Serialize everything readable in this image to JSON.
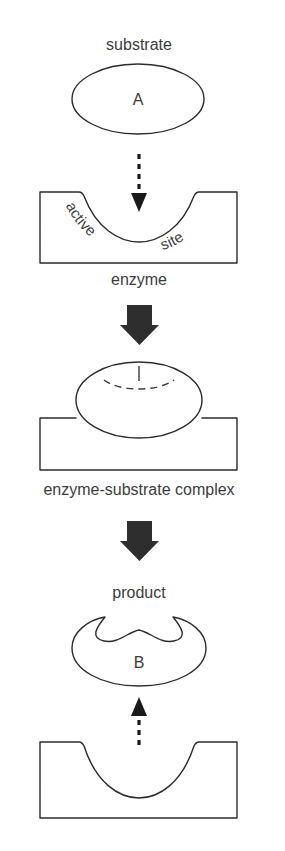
{
  "diagram": {
    "colors": {
      "background": "#ffffff",
      "outline": "#2b2b2b",
      "text": "#3c3c3c",
      "solid_arrow": "#2e2e2e",
      "dashed_arrow": "#1a1a1a"
    },
    "labels": {
      "substrate": "substrate",
      "substrate_letter": "A",
      "active_site": "active site",
      "active_site_word_1": "active",
      "active_site_word_2": "site",
      "enzyme": "enzyme",
      "complex": "enzyme-substrate complex",
      "product": "product",
      "product_letter": "B"
    },
    "stages": [
      {
        "name": "substrate-stage",
        "shape": "ellipse",
        "label": "substrate",
        "inner_letter": "A"
      },
      {
        "name": "enzyme-stage",
        "shape": "block-with-concave-notch",
        "label": "enzyme",
        "inner_label": "active site"
      },
      {
        "name": "complex-stage",
        "shape": "block-with-ellipse-bound",
        "label": "enzyme-substrate complex"
      },
      {
        "name": "product-stage",
        "shape": "wavy-top-ellipse",
        "label": "product",
        "inner_letter": "B"
      },
      {
        "name": "free-enzyme-stage",
        "shape": "block-with-concave-notch",
        "label": ""
      }
    ],
    "arrows": [
      {
        "name": "substrate-binding-arrow",
        "style": "dashed",
        "direction": "down"
      },
      {
        "name": "reaction-arrow-1",
        "style": "solid-thick",
        "direction": "down"
      },
      {
        "name": "reaction-arrow-2",
        "style": "solid-thick",
        "direction": "down"
      },
      {
        "name": "product-release-arrow",
        "style": "dashed",
        "direction": "up"
      }
    ]
  }
}
